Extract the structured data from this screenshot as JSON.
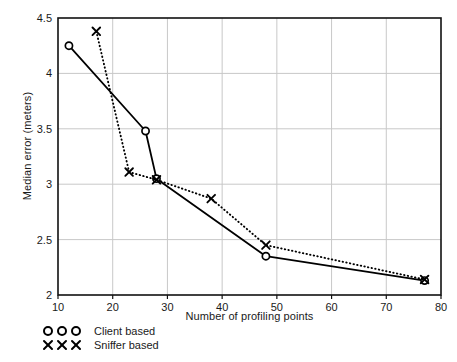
{
  "chart_data": {
    "type": "line",
    "title": "",
    "xlabel": "Number of profiling points",
    "ylabel": "Median error (meters)",
    "xlim": [
      10,
      80
    ],
    "ylim": [
      2,
      4.5
    ],
    "xticks": [
      10,
      20,
      30,
      40,
      50,
      60,
      70,
      80
    ],
    "xtick_labels": [
      "10",
      "20",
      "30",
      "40",
      "50",
      "60",
      "70",
      "80"
    ],
    "yticks": [
      2,
      2.5,
      3,
      3.5,
      4,
      4.5
    ],
    "ytick_labels": [
      "2",
      "2.5",
      "3",
      "3.5",
      "4",
      "4.5"
    ],
    "grid": true,
    "grid_color": "#c8c8c8",
    "axis_color": "#111111",
    "legend_position": "below-axes-left",
    "series": [
      {
        "name": "Client based",
        "marker": "circle",
        "linestyle": "solid",
        "color": "#000000",
        "x": [
          12,
          26,
          28,
          48,
          77
        ],
        "y": [
          4.25,
          3.48,
          3.05,
          2.35,
          2.13
        ]
      },
      {
        "name": "Sniffer based",
        "marker": "x",
        "linestyle": "dotted",
        "color": "#000000",
        "x": [
          17,
          23,
          28,
          38,
          48,
          77
        ],
        "y": [
          4.38,
          3.11,
          3.04,
          2.87,
          2.45,
          2.14
        ]
      }
    ]
  },
  "legend": {
    "items": [
      {
        "label": "Client based",
        "marker": "circle"
      },
      {
        "label": "Sniffer based",
        "marker": "x"
      }
    ]
  },
  "axes": {
    "x_title": "Number of profiling points",
    "y_title": "Median error (meters)"
  }
}
